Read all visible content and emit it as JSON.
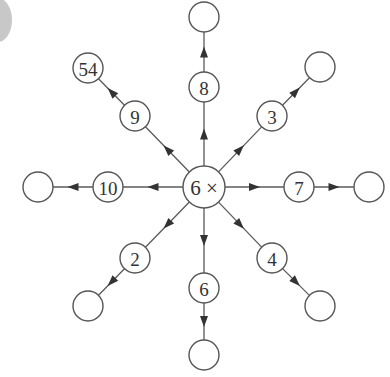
{
  "diagram": {
    "type": "multiplication-spider",
    "colors": {
      "stroke": "#555555",
      "text": "#333333",
      "arrow": "#333333",
      "corner_disc": "#c8c8c8"
    },
    "hub": {
      "label": "6 ×",
      "x": 204,
      "y": 187,
      "r": 21
    },
    "spokes": [
      {
        "dir": "up",
        "multiplier": "8",
        "mid": [
          204,
          87
        ],
        "end": [
          204,
          17
        ],
        "result": ""
      },
      {
        "dir": "up-right",
        "multiplier": "3",
        "mid": [
          272,
          116
        ],
        "end": [
          320,
          67
        ],
        "result": ""
      },
      {
        "dir": "right",
        "multiplier": "7",
        "mid": [
          299,
          187
        ],
        "end": [
          369,
          187
        ],
        "result": ""
      },
      {
        "dir": "down-right",
        "multiplier": "4",
        "mid": [
          272,
          258
        ],
        "end": [
          320,
          306
        ],
        "result": ""
      },
      {
        "dir": "down",
        "multiplier": "6",
        "mid": [
          204,
          288
        ],
        "end": [
          204,
          355
        ],
        "result": ""
      },
      {
        "dir": "down-left",
        "multiplier": "2",
        "mid": [
          135,
          258
        ],
        "end": [
          88,
          306
        ],
        "result": ""
      },
      {
        "dir": "left",
        "multiplier": "10",
        "mid": [
          108,
          187
        ],
        "end": [
          38,
          187
        ],
        "result": ""
      },
      {
        "dir": "up-left",
        "multiplier": "9",
        "mid": [
          135,
          116
        ],
        "end": [
          88,
          68
        ],
        "result": "54"
      }
    ],
    "mid_r": 15,
    "end_r": 15
  }
}
